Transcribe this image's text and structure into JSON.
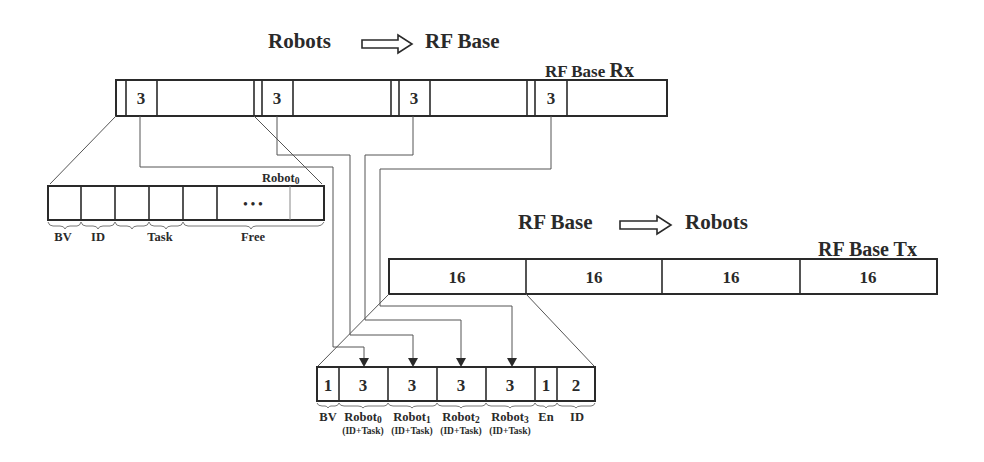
{
  "titles": {
    "uplink_from": "Robots",
    "uplink_to": "RF Base",
    "downlink_from": "RF Base",
    "downlink_to": "Robots"
  },
  "rx_frame": {
    "label": "RF Base Rx",
    "label_main": "RF Base ",
    "label_suffix": "Rx",
    "slots": [
      {
        "value": "3"
      },
      {
        "value": "3"
      },
      {
        "value": "3"
      },
      {
        "value": "3"
      }
    ]
  },
  "robot0_packet": {
    "label": "Robot0",
    "label_main": "Robot",
    "label_sub": "0",
    "ellipsis": "• • •",
    "fields": [
      {
        "name": "BV"
      },
      {
        "name": "ID"
      },
      {
        "name": "Task"
      },
      {
        "name": "Free"
      }
    ]
  },
  "tx_frame": {
    "label": "RF Base Tx",
    "label_main": "RF Base ",
    "label_suffix": "Tx",
    "slots": [
      {
        "value": "16"
      },
      {
        "value": "16"
      },
      {
        "value": "16"
      },
      {
        "value": "16"
      }
    ]
  },
  "tx_packet": {
    "cells": [
      {
        "value": "1",
        "label": "BV",
        "sublabel": ""
      },
      {
        "value": "3",
        "label": "Robot",
        "label_sub": "0",
        "sublabel": "(ID+Task)"
      },
      {
        "value": "3",
        "label": "Robot",
        "label_sub": "1",
        "sublabel": "(ID+Task)"
      },
      {
        "value": "3",
        "label": "Robot",
        "label_sub": "2",
        "sublabel": "(ID+Task)"
      },
      {
        "value": "3",
        "label": "Robot",
        "label_sub": "3",
        "sublabel": "(ID+Task)"
      },
      {
        "value": "1",
        "label": "En",
        "sublabel": ""
      },
      {
        "value": "2",
        "label": "ID",
        "sublabel": ""
      }
    ]
  },
  "colors": {
    "line": "#2a2a2a",
    "connector": "#555555",
    "background": "#ffffff"
  }
}
